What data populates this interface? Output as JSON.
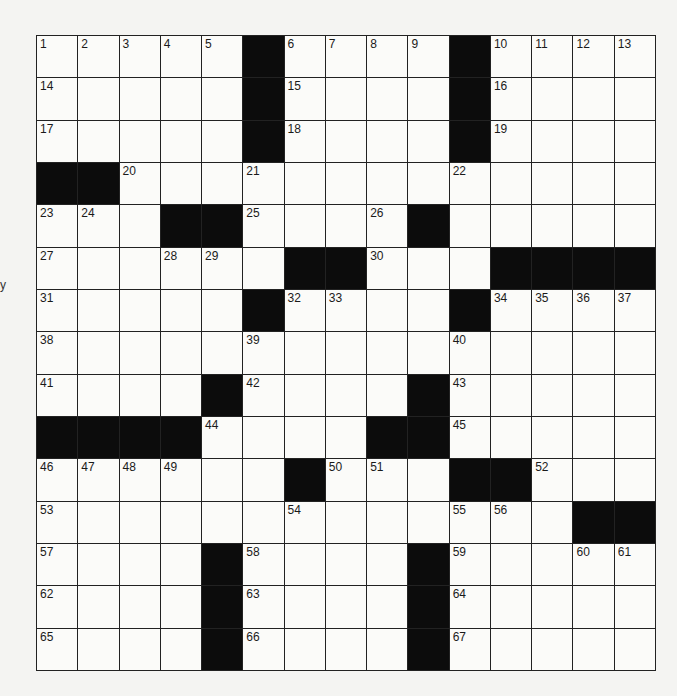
{
  "puzzle": {
    "rows": 15,
    "cols": 15,
    "black_cells": [
      [
        0,
        5
      ],
      [
        0,
        10
      ],
      [
        1,
        5
      ],
      [
        1,
        10
      ],
      [
        2,
        5
      ],
      [
        2,
        10
      ],
      [
        3,
        0
      ],
      [
        3,
        1
      ],
      [
        4,
        3
      ],
      [
        4,
        4
      ],
      [
        4,
        9
      ],
      [
        5,
        6
      ],
      [
        5,
        7
      ],
      [
        5,
        11
      ],
      [
        5,
        12
      ],
      [
        5,
        13
      ],
      [
        5,
        14
      ],
      [
        6,
        5
      ],
      [
        6,
        10
      ],
      [
        8,
        4
      ],
      [
        8,
        9
      ],
      [
        9,
        0
      ],
      [
        9,
        1
      ],
      [
        9,
        2
      ],
      [
        9,
        3
      ],
      [
        9,
        8
      ],
      [
        9,
        9
      ],
      [
        10,
        6
      ],
      [
        10,
        10
      ],
      [
        10,
        11
      ],
      [
        11,
        13
      ],
      [
        11,
        14
      ],
      [
        12,
        4
      ],
      [
        12,
        9
      ],
      [
        13,
        4
      ],
      [
        13,
        9
      ],
      [
        14,
        4
      ],
      [
        14,
        9
      ]
    ],
    "numbers": [
      {
        "r": 0,
        "c": 0,
        "n": "1"
      },
      {
        "r": 0,
        "c": 1,
        "n": "2"
      },
      {
        "r": 0,
        "c": 2,
        "n": "3"
      },
      {
        "r": 0,
        "c": 3,
        "n": "4"
      },
      {
        "r": 0,
        "c": 4,
        "n": "5"
      },
      {
        "r": 0,
        "c": 6,
        "n": "6"
      },
      {
        "r": 0,
        "c": 7,
        "n": "7"
      },
      {
        "r": 0,
        "c": 8,
        "n": "8"
      },
      {
        "r": 0,
        "c": 9,
        "n": "9"
      },
      {
        "r": 0,
        "c": 11,
        "n": "10"
      },
      {
        "r": 0,
        "c": 12,
        "n": "11"
      },
      {
        "r": 0,
        "c": 13,
        "n": "12"
      },
      {
        "r": 0,
        "c": 14,
        "n": "13"
      },
      {
        "r": 1,
        "c": 0,
        "n": "14"
      },
      {
        "r": 1,
        "c": 6,
        "n": "15"
      },
      {
        "r": 1,
        "c": 11,
        "n": "16"
      },
      {
        "r": 2,
        "c": 0,
        "n": "17"
      },
      {
        "r": 2,
        "c": 6,
        "n": "18"
      },
      {
        "r": 2,
        "c": 11,
        "n": "19"
      },
      {
        "r": 3,
        "c": 2,
        "n": "20"
      },
      {
        "r": 3,
        "c": 5,
        "n": "21"
      },
      {
        "r": 3,
        "c": 10,
        "n": "22"
      },
      {
        "r": 4,
        "c": 0,
        "n": "23"
      },
      {
        "r": 4,
        "c": 1,
        "n": "24"
      },
      {
        "r": 4,
        "c": 5,
        "n": "25"
      },
      {
        "r": 4,
        "c": 8,
        "n": "26"
      },
      {
        "r": 5,
        "c": 0,
        "n": "27"
      },
      {
        "r": 5,
        "c": 3,
        "n": "28"
      },
      {
        "r": 5,
        "c": 4,
        "n": "29"
      },
      {
        "r": 5,
        "c": 8,
        "n": "30"
      },
      {
        "r": 6,
        "c": 0,
        "n": "31"
      },
      {
        "r": 6,
        "c": 6,
        "n": "32"
      },
      {
        "r": 6,
        "c": 7,
        "n": "33"
      },
      {
        "r": 6,
        "c": 11,
        "n": "34"
      },
      {
        "r": 6,
        "c": 12,
        "n": "35"
      },
      {
        "r": 6,
        "c": 13,
        "n": "36"
      },
      {
        "r": 6,
        "c": 14,
        "n": "37"
      },
      {
        "r": 7,
        "c": 0,
        "n": "38"
      },
      {
        "r": 7,
        "c": 5,
        "n": "39"
      },
      {
        "r": 7,
        "c": 10,
        "n": "40"
      },
      {
        "r": 8,
        "c": 0,
        "n": "41"
      },
      {
        "r": 8,
        "c": 5,
        "n": "42"
      },
      {
        "r": 8,
        "c": 10,
        "n": "43"
      },
      {
        "r": 9,
        "c": 4,
        "n": "44"
      },
      {
        "r": 9,
        "c": 10,
        "n": "45"
      },
      {
        "r": 10,
        "c": 0,
        "n": "46"
      },
      {
        "r": 10,
        "c": 1,
        "n": "47"
      },
      {
        "r": 10,
        "c": 2,
        "n": "48"
      },
      {
        "r": 10,
        "c": 3,
        "n": "49"
      },
      {
        "r": 10,
        "c": 7,
        "n": "50"
      },
      {
        "r": 10,
        "c": 8,
        "n": "51"
      },
      {
        "r": 10,
        "c": 12,
        "n": "52"
      },
      {
        "r": 11,
        "c": 0,
        "n": "53"
      },
      {
        "r": 11,
        "c": 6,
        "n": "54"
      },
      {
        "r": 11,
        "c": 10,
        "n": "55"
      },
      {
        "r": 11,
        "c": 11,
        "n": "56"
      },
      {
        "r": 12,
        "c": 0,
        "n": "57"
      },
      {
        "r": 12,
        "c": 5,
        "n": "58"
      },
      {
        "r": 12,
        "c": 10,
        "n": "59"
      },
      {
        "r": 12,
        "c": 13,
        "n": "60"
      },
      {
        "r": 12,
        "c": 14,
        "n": "61"
      },
      {
        "r": 13,
        "c": 0,
        "n": "62"
      },
      {
        "r": 13,
        "c": 5,
        "n": "63"
      },
      {
        "r": 13,
        "c": 10,
        "n": "64"
      },
      {
        "r": 14,
        "c": 0,
        "n": "65"
      },
      {
        "r": 14,
        "c": 5,
        "n": "66"
      },
      {
        "r": 14,
        "c": 10,
        "n": "67"
      }
    ]
  },
  "edge_mark": "y",
  "colors": {
    "black_square": "#0c0c0c",
    "white_square": "#fbfbf9",
    "grid_line": "#222222",
    "page": "#f4f4f2"
  }
}
